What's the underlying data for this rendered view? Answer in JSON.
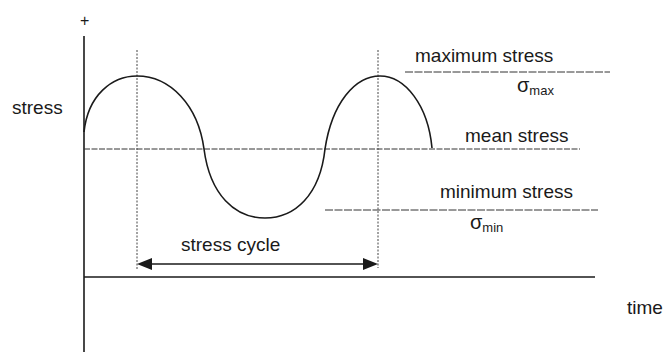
{
  "diagram": {
    "axis": {
      "y_label": "stress",
      "y_positive_marker": "+",
      "x_label": "time"
    },
    "levels": {
      "max_label": "maximum stress",
      "max_symbol": "σ",
      "max_subscript": "max",
      "mean_label": "mean stress",
      "min_label": "minimum stress",
      "min_symbol": "σ",
      "min_subscript": "min"
    },
    "cycle_label": "stress cycle",
    "colors": {
      "stroke": "#1a1a1a",
      "background": "#ffffff"
    }
  }
}
